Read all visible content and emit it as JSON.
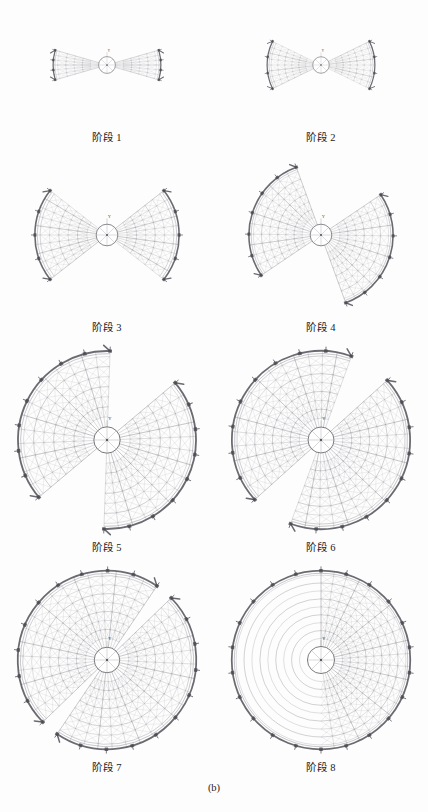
{
  "figure": {
    "caption": "(b)",
    "axis_marker": "Y",
    "type": "engineering-construction-sequence",
    "background_color": "#fdfdfd",
    "line_color": "#8e8e96",
    "accent_color": "#5a5a62",
    "bracket_color": "#4a4a52"
  },
  "stages": [
    {
      "label": "阶段 1",
      "index": 1,
      "sector_half_angle_deg": 16,
      "outer_radius": 96,
      "hub_radius": 15,
      "rib_count": 7,
      "ring_count": 5,
      "rotation_deg": 0
    },
    {
      "label": "阶段 2",
      "index": 2,
      "sector_half_angle_deg": 26,
      "outer_radius": 98,
      "hub_radius": 15,
      "rib_count": 9,
      "ring_count": 6,
      "rotation_deg": 0
    },
    {
      "label": "阶段 3",
      "index": 3,
      "sector_half_angle_deg": 38,
      "outer_radius": 100,
      "hub_radius": 15,
      "rib_count": 11,
      "ring_count": 6,
      "rotation_deg": 0
    },
    {
      "label": "阶段 4",
      "index": 4,
      "sector_half_angle_deg": 52,
      "outer_radius": 100,
      "hub_radius": 15,
      "rib_count": 13,
      "ring_count": 7,
      "rotation_deg": 18
    },
    {
      "label": "阶段 5",
      "index": 5,
      "sector_half_angle_deg": 66,
      "outer_radius": 108,
      "hub_radius": 16,
      "rib_count": 15,
      "ring_count": 7,
      "rotation_deg": 26
    },
    {
      "label": "阶段 6",
      "index": 6,
      "sector_half_angle_deg": 76,
      "outer_radius": 110,
      "hub_radius": 16,
      "rib_count": 17,
      "ring_count": 8,
      "rotation_deg": 34
    },
    {
      "label": "阶段 7",
      "index": 7,
      "sector_half_angle_deg": 84,
      "outer_radius": 112,
      "hub_radius": 16,
      "rib_count": 19,
      "ring_count": 8,
      "rotation_deg": 40
    },
    {
      "label": "阶段 8",
      "index": 8,
      "sector_half_angle_deg": 90,
      "outer_radius": 112,
      "hub_radius": 17,
      "rib_count": 21,
      "ring_count": 9,
      "rotation_deg": 0
    }
  ]
}
